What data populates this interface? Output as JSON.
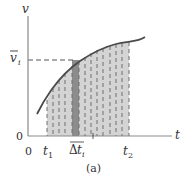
{
  "diagram": {
    "caption": "(a)",
    "y_axis": {
      "label": "v",
      "origin_label": "0"
    },
    "x_axis": {
      "label": "t",
      "origin_label": "0"
    },
    "mean_value_label": {
      "base": "v",
      "overbar": true,
      "subscript": "i"
    },
    "interval_labels": {
      "start": {
        "base": "t",
        "subscript": "1"
      },
      "end": {
        "base": "t",
        "subscript": "2"
      },
      "strip_width": {
        "prefix": "Δ",
        "base": "t",
        "subscript": "i"
      }
    },
    "shaded_region": {
      "strips": 14,
      "highlighted_strip_index": 5
    },
    "colors": {
      "axis": "#8a8a8a",
      "curve": "#4a4a4a",
      "shade": "#d4d4d4",
      "highlight_strip": "#8c8c8c",
      "dashes": "#6e6e6e",
      "text": "#333333"
    }
  }
}
